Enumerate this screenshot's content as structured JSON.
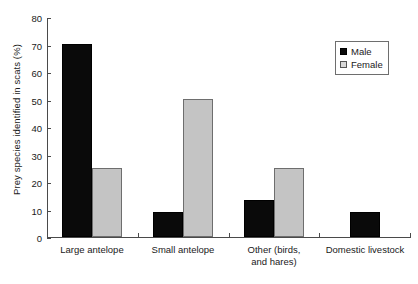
{
  "chart_data": {
    "type": "bar",
    "title": "",
    "xlabel": "",
    "ylabel": "Prey species identified in scats (%)",
    "categories": [
      "Large antelope",
      "Small antelope",
      "Other (birds,\nand hares)",
      "Domestic livestock"
    ],
    "series": [
      {
        "name": "Male",
        "color": "#0a0a0a",
        "values": [
          70,
          9,
          13.5,
          9
        ]
      },
      {
        "name": "Female",
        "color": "#c4c4c4",
        "values": [
          25,
          50,
          25,
          null
        ]
      }
    ],
    "ylim": [
      0,
      80
    ],
    "yticks": [
      0,
      10,
      20,
      30,
      40,
      50,
      60,
      70,
      80
    ],
    "ytick_labels": [
      "0",
      "10",
      "20",
      "30",
      "40",
      "50",
      "60",
      "70",
      "80"
    ],
    "grid": false,
    "legend_position": "top-right",
    "legend_entries": [
      "Male",
      "Female"
    ]
  },
  "legend": {
    "items": [
      {
        "label": "Male",
        "swatch": "filled-square-black-icon"
      },
      {
        "label": "Female",
        "swatch": "filled-square-gray-icon"
      }
    ]
  },
  "axis": {
    "y_title": "Prey species identified in scats (%)",
    "y_ticks": [
      "0",
      "10",
      "20",
      "30",
      "40",
      "50",
      "60",
      "70",
      "80"
    ],
    "x_categories": [
      {
        "line1": "Large antelope",
        "line2": ""
      },
      {
        "line1": "Small antelope",
        "line2": ""
      },
      {
        "line1": "Other (birds,",
        "line2": "and hares)"
      },
      {
        "line1": "Domestic livestock",
        "line2": ""
      }
    ]
  }
}
